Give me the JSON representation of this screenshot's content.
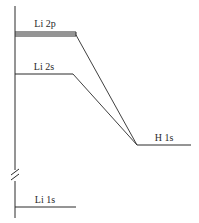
{
  "diagram": {
    "type": "molecular-orbital-energy-level",
    "colors": {
      "line": "#2a2a2a",
      "background": "#ffffff"
    },
    "axis": {
      "has_break": true
    },
    "levels": [
      {
        "id": "li-2p",
        "label": "Li 2p",
        "style": "triple-line"
      },
      {
        "id": "li-2s",
        "label": "Li 2s",
        "style": "single-line"
      },
      {
        "id": "h-1s",
        "label": "H 1s",
        "style": "single-line"
      },
      {
        "id": "li-1s",
        "label": "Li 1s",
        "style": "single-line"
      }
    ],
    "connections": [
      {
        "from": "Li 2p",
        "to": "H 1s"
      },
      {
        "from": "Li 2s",
        "to": "H 1s"
      }
    ]
  }
}
